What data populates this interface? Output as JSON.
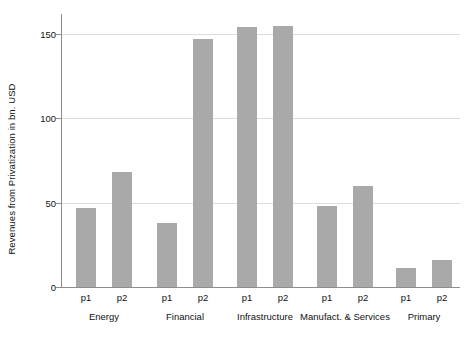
{
  "chart_data": {
    "type": "bar",
    "title": "",
    "xlabel": "",
    "ylabel": "Revenues from Privatization in bn. USD",
    "ylim": [
      0,
      162
    ],
    "yticks": [
      0,
      50,
      100,
      150
    ],
    "ytick_labels": [
      "0",
      "50",
      "100",
      "150"
    ],
    "grid": true,
    "legend": "none",
    "categories": [
      "Energy",
      "Financial",
      "Infrastructure",
      "Manufact. & Services",
      "Primary"
    ],
    "subcategories": [
      "p1",
      "p2"
    ],
    "series": [
      {
        "name": "p1",
        "values": [
          47,
          38,
          154,
          48,
          11
        ]
      },
      {
        "name": "p2",
        "values": [
          68,
          147,
          155,
          60,
          16
        ]
      }
    ],
    "bars": [
      {
        "group": "Energy",
        "sub": "p1",
        "value": 47
      },
      {
        "group": "Energy",
        "sub": "p2",
        "value": 68
      },
      {
        "group": "Financial",
        "sub": "p1",
        "value": 38
      },
      {
        "group": "Financial",
        "sub": "p2",
        "value": 147
      },
      {
        "group": "Infrastructure",
        "sub": "p1",
        "value": 154
      },
      {
        "group": "Infrastructure",
        "sub": "p2",
        "value": 155
      },
      {
        "group": "Manufact. & Services",
        "sub": "p1",
        "value": 48
      },
      {
        "group": "Manufact. & Services",
        "sub": "p2",
        "value": 60
      },
      {
        "group": "Primary",
        "sub": "p1",
        "value": 11
      },
      {
        "group": "Primary",
        "sub": "p2",
        "value": 16
      }
    ],
    "colors": {
      "bar_fill": "#a9a9a9",
      "gridline": "#dcdcdc",
      "axis": "#8d8d8d",
      "background": "#ffffff",
      "text": "#111111"
    }
  }
}
